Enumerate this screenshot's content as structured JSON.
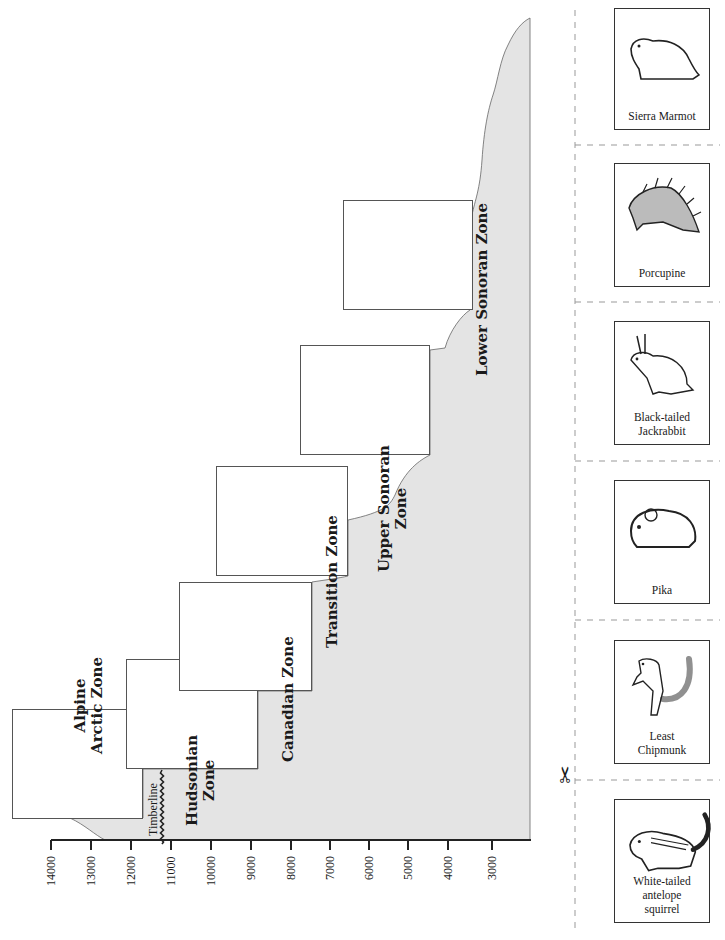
{
  "diagram": {
    "axis": {
      "label_unit": "feet",
      "ticks": [
        "14000",
        "13000",
        "12000",
        "11000",
        "10000",
        "9000",
        "8000",
        "7000",
        "6000",
        "5000",
        "4000",
        "3000"
      ]
    },
    "timberline_label": "Timberline",
    "zones": [
      {
        "name": "Alpine Arctic Zone",
        "line1": "Alpine",
        "line2": "Arctic Zone"
      },
      {
        "name": "Hudsonian Zone",
        "line1": "Hudsonian",
        "line2": "Zone"
      },
      {
        "name": "Canadian Zone",
        "line1": "Canadian Zone",
        "line2": ""
      },
      {
        "name": "Transition Zone",
        "line1": "Transition Zone",
        "line2": ""
      },
      {
        "name": "Upper Sonoran Zone",
        "line1": "Upper Sonoran",
        "line2": "Zone"
      },
      {
        "name": "Lower Sonoran Zone",
        "line1": "Lower Sonoran Zone",
        "line2": ""
      }
    ],
    "colors": {
      "mountain_fill": "#e4e4e4",
      "outline": "#555555",
      "axis": "#222222"
    }
  },
  "cutouts": {
    "scissors_icon": "scissors",
    "cards": [
      {
        "caption_lines": [
          "Sierra Marmot"
        ],
        "animal": "marmot"
      },
      {
        "caption_lines": [
          "Porcupine"
        ],
        "animal": "porcupine"
      },
      {
        "caption_lines": [
          "Black-tailed",
          "Jackrabbit"
        ],
        "animal": "jackrabbit"
      },
      {
        "caption_lines": [
          "Pika"
        ],
        "animal": "pika"
      },
      {
        "caption_lines": [
          "Least",
          "Chipmunk"
        ],
        "animal": "chipmunk"
      },
      {
        "caption_lines": [
          "White-tailed",
          "antelope",
          "squirrel"
        ],
        "animal": "antelope-squirrel"
      }
    ]
  }
}
